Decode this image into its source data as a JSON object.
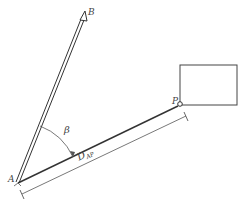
{
  "diagram": {
    "labels": {
      "point_a": "A",
      "point_b": "B",
      "point_p": "P",
      "angle": "β",
      "distance_main": "D",
      "distance_sub": "AP"
    },
    "colors": {
      "stroke": "#333333",
      "thin_stroke": "#555555",
      "label": "#444444",
      "background": "#ffffff"
    }
  }
}
